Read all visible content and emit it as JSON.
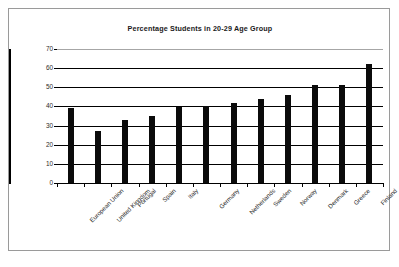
{
  "chart_data": {
    "type": "bar",
    "title": "Percentage Students in 20-29 Age Group",
    "xlabel": "",
    "ylabel": "",
    "ylim": [
      0,
      70
    ],
    "ytick_step": 10,
    "yticks": [
      "0",
      "10",
      "20",
      "30",
      "40",
      "50",
      "60",
      "70"
    ],
    "grid": true,
    "grid_axis": "y",
    "legend": false,
    "bar_color": "#0b0b0b",
    "categories": [
      "European Union",
      "United Kingdom",
      "Portugal",
      "Spain",
      "Italy",
      "Germany",
      "Netherlands",
      "Sweden",
      "Norway",
      "Denmark",
      "Greece",
      "Finland"
    ],
    "values": [
      39,
      27,
      33,
      35,
      39.5,
      40,
      42,
      44,
      46,
      51,
      51,
      62
    ]
  },
  "colors": {
    "frame_border": "#9a9a9a",
    "axis": "#000000",
    "gridline": "#000000",
    "top_gridline": "#a6a6a6",
    "bar": "#0b0b0b",
    "text": "#2b2b2b",
    "background": "#ffffff"
  }
}
